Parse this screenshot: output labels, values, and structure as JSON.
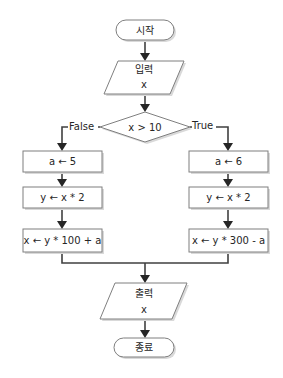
{
  "diagram": {
    "type": "flowchart",
    "nodes": {
      "start": {
        "label": "시작",
        "shape": "terminator"
      },
      "input": {
        "title": "입력",
        "var": "x",
        "shape": "parallelogram"
      },
      "decision": {
        "label": "x > 10",
        "shape": "diamond"
      },
      "false_branch": [
        {
          "label": "a ← 5"
        },
        {
          "label": "y ← x * 2"
        },
        {
          "label": "x ← y * 100 + a"
        }
      ],
      "true_branch": [
        {
          "label": "a ← 6"
        },
        {
          "label": "y ← x * 2"
        },
        {
          "label": "x ← y * 300 - a"
        }
      ],
      "output": {
        "title": "출력",
        "var": "x",
        "shape": "parallelogram"
      },
      "end": {
        "label": "종료",
        "shape": "terminator"
      }
    },
    "edge_labels": {
      "false": "False",
      "true": "True"
    },
    "colors": {
      "shape_stroke": "#7f7f7f",
      "connector": "#404040",
      "text": "#262626"
    }
  }
}
